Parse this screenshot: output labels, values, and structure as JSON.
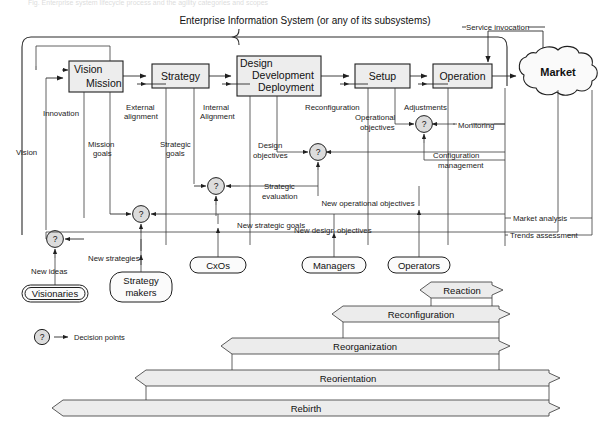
{
  "diagram": {
    "title": "Enterprise Information System (or any of its subsystems)",
    "process_boxes": [
      {
        "id": "vision-mission",
        "line1": "Vision",
        "line2": "Mission"
      },
      {
        "id": "strategy",
        "line1": "Strategy",
        "line2": ""
      },
      {
        "id": "design-development-deployment",
        "line1": "Design",
        "line2": "Development",
        "line3": "Deployment"
      },
      {
        "id": "setup",
        "line1": "Setup",
        "line2": ""
      },
      {
        "id": "operation",
        "line1": "Operation",
        "line2": ""
      }
    ],
    "market": "Market",
    "edge_labels": {
      "service_invocation": "Service invocation",
      "innovation": "Innovation",
      "vision": "Vision",
      "external_alignment_1": "External",
      "external_alignment_2": "alignment",
      "internal_alignment_1": "Internal",
      "internal_alignment_2": "Alignment",
      "reconfiguration": "Reconfiguration",
      "adjustments": "Adjustments",
      "mission_goals_1": "Mission",
      "mission_goals_2": "goals",
      "strategic_goals_1": "Strategic",
      "strategic_goals_2": "goals",
      "design_objectives_1": "Design",
      "design_objectives_2": "objectives",
      "operational_objectives_1": "Operational",
      "operational_objectives_2": "objectives",
      "monitoring": "Monitoring",
      "configuration_management_1": "Configuration",
      "configuration_management_2": "management",
      "strategic_evaluation_1": "Strategic",
      "strategic_evaluation_2": "evaluation",
      "new_operational_objectives": "New operational objectives",
      "new_strategic_goals": "New strategic goals",
      "new_design_objectives": "New design objectives",
      "market_analysis": "Market analysis",
      "trends_assessment": "Trends assessment",
      "new_strategies": "New strategies",
      "new_ideas": "New ideas"
    },
    "roles": [
      {
        "id": "visionaries",
        "line1": "Visionaries",
        "line2": ""
      },
      {
        "id": "strategy-makers",
        "line1": "Strategy",
        "line2": "makers"
      },
      {
        "id": "cxos",
        "line1": "CxOs",
        "line2": ""
      },
      {
        "id": "managers",
        "line1": "Managers",
        "line2": ""
      },
      {
        "id": "operators",
        "line1": "Operators",
        "line2": ""
      }
    ],
    "legend": {
      "symbol": "?",
      "text": "Decision points"
    },
    "decision_symbol": "?",
    "bands": [
      {
        "id": "reaction",
        "label": "Reaction"
      },
      {
        "id": "reconfiguration",
        "label": "Reconfiguration"
      },
      {
        "id": "reorganization",
        "label": "Reorganization"
      },
      {
        "id": "reorientation",
        "label": "Reorientation"
      },
      {
        "id": "rebirth",
        "label": "Rebirth"
      }
    ],
    "colors": {
      "box_fill": "#ededed",
      "band_fill": "#ececec",
      "stroke": "#1f1f1f",
      "decision_fill": "#dcdcdc",
      "background": "#ffffff"
    }
  }
}
